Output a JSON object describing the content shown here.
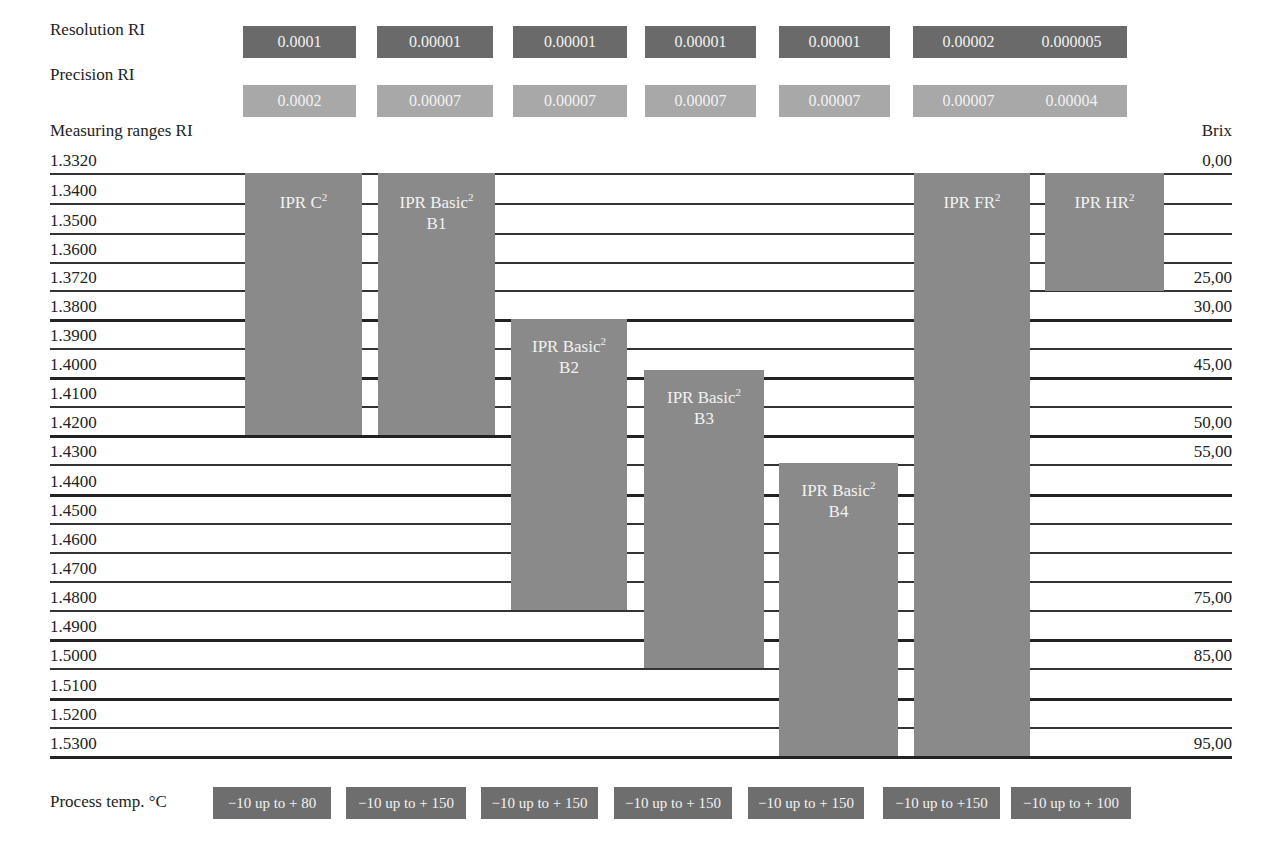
{
  "labels": {
    "resolution": "Resolution RI",
    "precision": "Precision RI",
    "measuring_ranges": "Measuring ranges RI",
    "brix": "Brix",
    "process_temp": "Process temp. °C"
  },
  "resolution": [
    "0.0001",
    "0.00001",
    "0.00001",
    "0.00001",
    "0.00001",
    "0.00002",
    "0.000005"
  ],
  "precision": [
    "0.0002",
    "0.00007",
    "0.00007",
    "0.00007",
    "0.00007",
    "0.00007",
    "0.00004"
  ],
  "ri_ticks": [
    "1.3320",
    "1.3400",
    "1.3500",
    "1.3600",
    "1.3720",
    "1.3800",
    "1.3900",
    "1.4000",
    "1.4100",
    "1.4200",
    "1.4300",
    "1.4400",
    "1.4500",
    "1.4600",
    "1.4700",
    "1.4800",
    "1.4900",
    "1.5000",
    "1.5100",
    "1.5200",
    "1.5300"
  ],
  "brix_ticks": {
    "0": "0,00",
    "4": "25,00",
    "5": "30,00",
    "7": "45,00",
    "9": "50,00",
    "10": "55,00",
    "15": "75,00",
    "17": "85,00",
    "20": "95,00"
  },
  "instruments": [
    {
      "name": "IPR C",
      "sup": "2",
      "sub": "",
      "ri_min": "1.3320",
      "ri_max": "1.4200"
    },
    {
      "name": "IPR Basic",
      "sup": "2",
      "sub": "B1",
      "ri_min": "1.3320",
      "ri_max": "1.4200"
    },
    {
      "name": "IPR Basic",
      "sup": "2",
      "sub": "B2",
      "ri_min": "1.3800",
      "ri_max": "1.4800"
    },
    {
      "name": "IPR Basic",
      "sup": "2",
      "sub": "B3",
      "ri_min": "1.3980",
      "ri_max": "1.5000"
    },
    {
      "name": "IPR Basic",
      "sup": "2",
      "sub": "B4",
      "ri_min": "1.4300",
      "ri_max": "1.5300"
    },
    {
      "name": "IPR FR",
      "sup": "2",
      "sub": "",
      "ri_min": "1.3320",
      "ri_max": "1.5300"
    },
    {
      "name": "IPR HR",
      "sup": "2",
      "sub": "",
      "ri_min": "1.3320",
      "ri_max": "1.3720"
    }
  ],
  "process_temp": [
    "−10 up to + 80",
    "−10 up to + 150",
    "−10 up to + 150",
    "−10 up to + 150",
    "−10 up to + 150",
    "−10 up to +150",
    "−10 up to + 100"
  ],
  "chart_data": {
    "type": "bar",
    "title": "",
    "xlabel": "",
    "ylabel": "Measuring ranges RI",
    "y2label": "Brix",
    "orientation": "floating-range",
    "categories": [
      "IPR C²",
      "IPR Basic² B1",
      "IPR Basic² B2",
      "IPR Basic² B3",
      "IPR Basic² B4",
      "IPR FR²",
      "IPR HR²"
    ],
    "series": [
      {
        "name": "RI min",
        "values": [
          1.332,
          1.332,
          1.38,
          1.398,
          1.43,
          1.332,
          1.332
        ]
      },
      {
        "name": "RI max",
        "values": [
          1.42,
          1.42,
          1.48,
          1.5,
          1.53,
          1.53,
          1.372
        ]
      }
    ],
    "resolution_RI": [
      0.0001,
      1e-05,
      1e-05,
      1e-05,
      1e-05,
      2e-05,
      5e-06
    ],
    "precision_RI": [
      0.0002,
      7e-05,
      7e-05,
      7e-05,
      7e-05,
      7e-05,
      4e-05
    ],
    "process_temp_C": [
      [
        -10,
        80
      ],
      [
        -10,
        150
      ],
      [
        -10,
        150
      ],
      [
        -10,
        150
      ],
      [
        -10,
        150
      ],
      [
        -10,
        150
      ],
      [
        -10,
        100
      ]
    ],
    "yticks": [
      1.332,
      1.34,
      1.35,
      1.36,
      1.372,
      1.38,
      1.39,
      1.4,
      1.41,
      1.42,
      1.43,
      1.44,
      1.45,
      1.46,
      1.47,
      1.48,
      1.49,
      1.5,
      1.51,
      1.52,
      1.53
    ],
    "brix_ticks": {
      "1.3320": "0,00",
      "1.3720": "25,00",
      "1.3800": "30,00",
      "1.4000": "45,00",
      "1.4200": "50,00",
      "1.4300": "55,00",
      "1.4800": "75,00",
      "1.5000": "85,00",
      "1.5300": "95,00"
    },
    "ylim": [
      1.332,
      1.53
    ],
    "grid": true,
    "legend": "none"
  }
}
